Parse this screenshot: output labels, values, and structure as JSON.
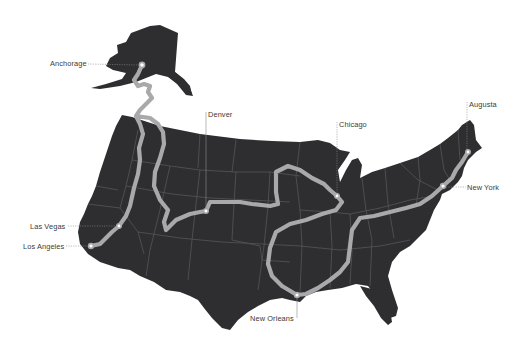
{
  "map": {
    "type": "route-map",
    "region": "United States",
    "colors": {
      "land": "#2e2e31",
      "state_borders": "#55555a",
      "route": "#a9a9ab",
      "background": "#ffffff",
      "label_text": "#3a3a3a"
    },
    "cities": [
      {
        "name": "Anchorage",
        "x": 142,
        "y": 65
      },
      {
        "name": "Denver",
        "x": 206,
        "y": 211
      },
      {
        "name": "Chicago",
        "x": 337,
        "y": 196
      },
      {
        "name": "Augusta",
        "x": 468,
        "y": 152
      },
      {
        "name": "New York",
        "x": 443,
        "y": 186
      },
      {
        "name": "Las Vegas",
        "x": 119,
        "y": 226
      },
      {
        "name": "Los Angeles",
        "x": 91,
        "y": 246
      },
      {
        "name": "New Orleans",
        "x": 297,
        "y": 295
      }
    ]
  },
  "labels": {
    "anchorage": "Anchorage",
    "denver": "Denver",
    "chicago": "Chicago",
    "augusta": "Augusta",
    "new_york": "New York",
    "las_vegas": "Las Vegas",
    "los_angeles": "Los Angeles",
    "new_orleans": "New Orleans"
  }
}
